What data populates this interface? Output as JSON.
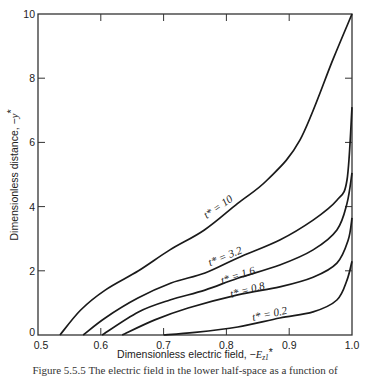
{
  "chart_data": {
    "type": "line",
    "title": "",
    "xlabel": "Dimensionless electric field, −E_z1*",
    "ylabel": "Dimensionless distance, −y*",
    "xlim": [
      0.5,
      1.0
    ],
    "ylim": [
      0,
      10
    ],
    "xticks": [
      0.5,
      0.6,
      0.7,
      0.8,
      0.9,
      1.0
    ],
    "xtick_labels": [
      "0.5",
      "0.6",
      "0.7",
      "0.8",
      "0.9",
      "1.0"
    ],
    "yticks": [
      0,
      2,
      4,
      6,
      8,
      10
    ],
    "ytick_labels": [
      "0",
      "2",
      "4",
      "6",
      "8",
      "10"
    ],
    "grid": false,
    "legend": "inline curve labels",
    "series": [
      {
        "name": "t* = 10",
        "label_pos": [
          0.79,
          3.9
        ],
        "label_angle": -35,
        "x": [
          0.535,
          0.568,
          0.607,
          0.66,
          0.71,
          0.765,
          0.818,
          0.865,
          0.917,
          0.97,
          1.0
        ],
        "y": [
          0,
          0.78,
          1.4,
          2.0,
          2.65,
          3.27,
          4.1,
          4.83,
          6.07,
          8.6,
          10.0
        ]
      },
      {
        "name": "t* = 3.2",
        "label_pos": [
          0.8,
          2.35
        ],
        "label_angle": -22,
        "x": [
          0.572,
          0.607,
          0.659,
          0.712,
          0.766,
          0.818,
          0.885,
          0.938,
          0.976,
          0.992,
          1.0
        ],
        "y": [
          0,
          0.53,
          1.15,
          1.62,
          1.93,
          2.4,
          2.96,
          3.58,
          4.2,
          4.83,
          7.1
        ]
      },
      {
        "name": "t* = 1.6",
        "label_pos": [
          0.82,
          1.75
        ],
        "label_angle": -18,
        "x": [
          0.602,
          0.66,
          0.71,
          0.766,
          0.818,
          0.885,
          0.938,
          0.976,
          0.992,
          1.0
        ],
        "y": [
          0,
          0.72,
          1.09,
          1.4,
          1.77,
          2.18,
          2.65,
          3.27,
          4.1,
          5.05
        ]
      },
      {
        "name": "t* = 0.8",
        "label_pos": [
          0.835,
          1.3
        ],
        "label_angle": -15,
        "x": [
          0.634,
          0.686,
          0.739,
          0.818,
          0.885,
          0.938,
          0.976,
          0.994,
          1.0
        ],
        "y": [
          0,
          0.47,
          0.84,
          1.25,
          1.5,
          1.8,
          2.24,
          2.96,
          3.65
        ]
      },
      {
        "name": "t* = 0.2",
        "label_pos": [
          0.87,
          0.55
        ],
        "label_angle": -12,
        "x": [
          0.7,
          0.75,
          0.818,
          0.885,
          0.938,
          0.976,
          0.992,
          1.0
        ],
        "y": [
          0,
          0.08,
          0.25,
          0.53,
          0.72,
          1.09,
          1.71,
          2.3
        ]
      }
    ]
  },
  "caption": "Figure 5.5.5  The electric field in the lower half-space as a function of"
}
